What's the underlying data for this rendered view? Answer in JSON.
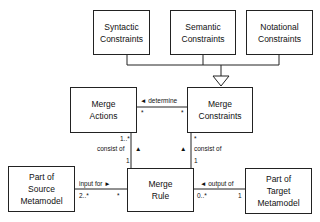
{
  "diagram": {
    "type": "uml-class-diagram",
    "nodes": {
      "syntactic": {
        "label": "Syntactic\nConstraints"
      },
      "semantic": {
        "label": "Semantic\nConstraints"
      },
      "notational": {
        "label": "Notational\nConstraints"
      },
      "merge_actions": {
        "label": "Merge\nActions"
      },
      "merge_constraints": {
        "label": "Merge\nConstraints"
      },
      "merge_rule": {
        "label": "Merge\nRule"
      },
      "source": {
        "label": "Part of\nSource\nMetamodel"
      },
      "target": {
        "label": "Part of\nTarget\nMetamodel"
      }
    },
    "edges": {
      "generalization": {
        "from": [
          "Syntactic Constraints",
          "Semantic Constraints",
          "Notational Constraints"
        ],
        "to": "Merge Constraints",
        "kind": "generalization"
      },
      "determine": {
        "label": "◄ determine",
        "source_mult": "*",
        "target_mult": "*"
      },
      "actions_consist": {
        "label": "consist of",
        "arrow": "▲",
        "mult_top": "1..*",
        "mult_bottom": "1"
      },
      "constraints_consist": {
        "label": "consist of",
        "arrow": "▲",
        "mult_top": "*",
        "mult_bottom": "1"
      },
      "input_for": {
        "label": "input for ►",
        "mult_left": "2..*",
        "mult_right": "*"
      },
      "output_of": {
        "label": "◄ output of",
        "mult_left": "0..*",
        "mult_right": "1"
      }
    }
  }
}
